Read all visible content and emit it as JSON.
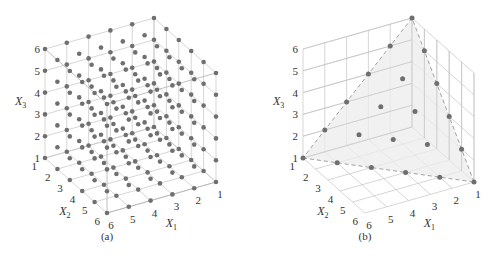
{
  "chart_data": [
    {
      "type": "scatter",
      "subtype": "3d-lattice",
      "caption": "(a)",
      "xlabel": "X1",
      "ylabel": "X2",
      "zlabel": "X3",
      "x_ticks": [
        1,
        2,
        3,
        4,
        5,
        6
      ],
      "y_ticks": [
        1,
        2,
        3,
        4,
        5,
        6
      ],
      "z_ticks": [
        1,
        2,
        3,
        4,
        5,
        6
      ],
      "xlim": [
        1,
        6
      ],
      "ylim": [
        1,
        6
      ],
      "zlim": [
        1,
        6
      ],
      "grid": true,
      "points": "all integer points (X1, X2, X3) with 1 <= Xi <= 6 (216 points)",
      "point_count": 216
    },
    {
      "type": "scatter",
      "subtype": "3d-simplex-slice",
      "caption": "(b)",
      "xlabel": "X1",
      "ylabel": "X2",
      "zlabel": "X3",
      "x_ticks": [
        1,
        2,
        3,
        4,
        5,
        6
      ],
      "y_ticks": [
        1,
        2,
        3,
        4,
        5,
        6
      ],
      "z_ticks": [
        1,
        2,
        3,
        4,
        5,
        6
      ],
      "xlim": [
        1,
        6
      ],
      "ylim": [
        1,
        6
      ],
      "zlim": [
        1,
        6
      ],
      "grid": true,
      "constraint": "X1 + X2 + X3 = 8",
      "plane_vertices": [
        [
          6,
          1,
          1
        ],
        [
          1,
          6,
          1
        ],
        [
          1,
          1,
          6
        ]
      ],
      "point_count": 21,
      "points": [
        [
          6,
          1,
          1
        ],
        [
          5,
          2,
          1
        ],
        [
          4,
          3,
          1
        ],
        [
          3,
          4,
          1
        ],
        [
          2,
          5,
          1
        ],
        [
          1,
          6,
          1
        ],
        [
          5,
          1,
          2
        ],
        [
          4,
          2,
          2
        ],
        [
          3,
          3,
          2
        ],
        [
          2,
          4,
          2
        ],
        [
          1,
          5,
          2
        ],
        [
          4,
          1,
          3
        ],
        [
          3,
          2,
          3
        ],
        [
          2,
          3,
          3
        ],
        [
          1,
          4,
          3
        ],
        [
          3,
          1,
          4
        ],
        [
          2,
          2,
          4
        ],
        [
          1,
          3,
          4
        ],
        [
          2,
          1,
          5
        ],
        [
          1,
          2,
          5
        ],
        [
          1,
          1,
          6
        ]
      ]
    }
  ],
  "labels": {
    "x1": "X",
    "x1_sub": "1",
    "x2": "X",
    "x2_sub": "2",
    "x3": "X",
    "x3_sub": "3",
    "caption_a": "(a)",
    "caption_b": "(b)"
  },
  "colors": {
    "dot": "#6f6f6f",
    "grid": "#c4c4c4",
    "plane": "#ececec",
    "dash": "#8a8a8a"
  }
}
